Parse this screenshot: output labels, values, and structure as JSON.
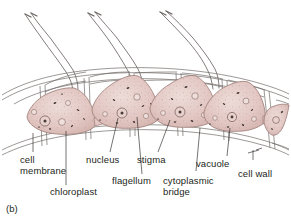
{
  "figure": {
    "panel_letter": "(b)",
    "background_color": "#ffffff",
    "ink_color": "#55504e",
    "cell_fill_color": "#e3c8c4",
    "cell_outline_color": "#8d6f6b",
    "granule_color": "#4a3b38",
    "label_color": "#231f20"
  },
  "labels": [
    {
      "id": "cell-membrane",
      "line1": "cell",
      "line2": "membrane"
    },
    {
      "id": "chloroplast",
      "line1": "chloroplast",
      "line2": ""
    },
    {
      "id": "nucleus",
      "line1": "nucleus",
      "line2": ""
    },
    {
      "id": "flagellum",
      "line1": "flagellum",
      "line2": ""
    },
    {
      "id": "stigma",
      "line1": "stigma",
      "line2": ""
    },
    {
      "id": "cytoplasmic-bridge",
      "line1": "cytoplasmic",
      "line2": "bridge"
    },
    {
      "id": "vacuole",
      "line1": "vacuole",
      "line2": ""
    },
    {
      "id": "cell-wall",
      "line1": "cell wall",
      "line2": ""
    }
  ],
  "structures": {
    "cell_count": 5,
    "flagella_per_cell": 2,
    "visible_flagella_groups": 3,
    "cell_wall_compartments": "hexagonal mesh",
    "organelles": [
      "nucleus",
      "stigma",
      "chloroplast",
      "vacuole",
      "cytoplasmic bridge",
      "cell membrane",
      "cell wall",
      "flagellum"
    ]
  }
}
